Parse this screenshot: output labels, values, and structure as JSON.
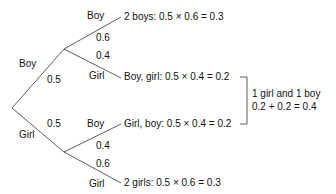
{
  "diagram": {
    "type": "probability-tree",
    "line_color": "#333333",
    "text_color": "#111111",
    "first_level": {
      "boy": {
        "label": "Boy",
        "probability": "0.5"
      },
      "girl": {
        "label": "Girl",
        "probability": "0.5"
      }
    },
    "second_level": {
      "after_boy": {
        "boy": {
          "label": "Boy",
          "probability": "0.6"
        },
        "girl": {
          "label": "Girl",
          "probability": "0.4"
        }
      },
      "after_girl": {
        "boy": {
          "label": "Boy",
          "probability": "0.4"
        },
        "girl": {
          "label": "Girl",
          "probability": "0.6"
        }
      }
    },
    "outcomes": [
      {
        "text": "2 boys: 0.5 × 0.6 = 0.3"
      },
      {
        "text": "Boy, girl: 0.5 × 0.4 = 0.2"
      },
      {
        "text": "Girl, boy: 0.5 × 0.4 = 0.2"
      },
      {
        "text": "2 girls: 0.5 × 0.6 = 0.3"
      }
    ],
    "bracket_note": {
      "line1": "1 girl and 1 boy",
      "line2": "0.2 + 0.2 = 0.4"
    }
  }
}
